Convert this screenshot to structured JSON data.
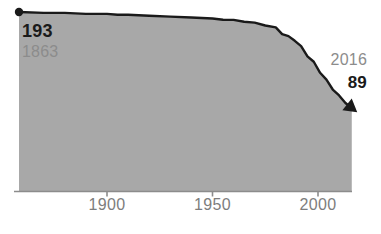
{
  "chart_data": {
    "type": "area",
    "title": "",
    "subtitle": "",
    "xlabel": "",
    "ylabel": "",
    "xlim": [
      1863,
      2016
    ],
    "ylim": [
      0,
      200
    ],
    "grid": false,
    "legend_position": "none",
    "fill_color": "#a8a8a8",
    "line_color": "#1a1a1a",
    "axis_color": "#8c8c8c",
    "x": [
      1863,
      1870,
      1880,
      1890,
      1900,
      1905,
      1910,
      1920,
      1930,
      1940,
      1950,
      1955,
      1960,
      1965,
      1970,
      1975,
      1980,
      1983,
      1986,
      1989,
      1992,
      1995,
      1998,
      2001,
      2004,
      2007,
      2010,
      2013,
      2016
    ],
    "values": [
      193,
      192,
      192,
      191,
      191,
      190,
      190,
      189,
      188,
      187,
      186,
      185,
      184,
      183,
      181,
      179,
      176,
      170,
      166,
      163,
      155,
      146,
      138,
      128,
      119,
      110,
      102,
      95,
      89
    ],
    "xticks": [
      1900,
      1950,
      2000
    ],
    "xtick_labels": [
      "1900",
      "1950",
      "2000"
    ],
    "start_point": {
      "year": 1863,
      "value": 193,
      "marker": "filled-circle"
    },
    "end_point": {
      "year": 2016,
      "value": 89,
      "marker": "arrowhead"
    },
    "annotations": [
      {
        "name": "start-value",
        "text": "193",
        "style": "bold-black"
      },
      {
        "name": "start-year",
        "text": "1863",
        "style": "regular-gray"
      },
      {
        "name": "end-year",
        "text": "2016",
        "style": "regular-gray"
      },
      {
        "name": "end-value",
        "text": "89",
        "style": "bold-black"
      }
    ]
  },
  "labels": {
    "start_value": "193",
    "start_year": "1863",
    "end_year": "2016",
    "end_value": "89"
  },
  "axis": {
    "tick_labels": [
      "1900",
      "1950",
      "2000"
    ]
  }
}
